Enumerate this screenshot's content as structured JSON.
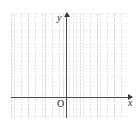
{
  "figure": {
    "kind": "cartesian-coordinate-grid",
    "background_color": "#ffffff",
    "axis_color": "#4a4a4f",
    "grid_major_color": "#787880",
    "grid_minor_color": "#96969b",
    "labels": {
      "y_axis": "y",
      "x_axis": "x",
      "origin": "O"
    }
  },
  "chart_data": {
    "type": "scatter",
    "title": "",
    "subtitle": "",
    "xlabel": "x",
    "ylabel": "y",
    "origin_label": "O",
    "grid": true,
    "grid_major_spacing_cells": 5,
    "grid_minor_cells_x": 34,
    "grid_minor_cells_y": 30,
    "legend": [],
    "annotations": [],
    "series": [],
    "x": [],
    "values": [],
    "xlim": [
      -16,
      18
    ],
    "ylim": [
      -6,
      24
    ],
    "tick_labels_x": [],
    "tick_labels_y": []
  }
}
